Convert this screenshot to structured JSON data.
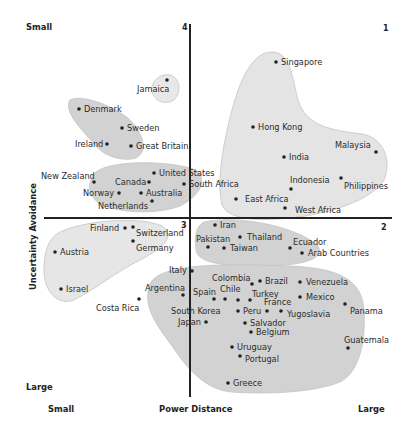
{
  "chart_data": {
    "type": "scatter",
    "title": "",
    "xlabel": "Power Distance",
    "ylabel": "Uncertainty Avoidance",
    "x_axis_ends": {
      "left": "Small",
      "right": "Large"
    },
    "y_axis_ends": {
      "top": "Small",
      "bottom": "Large"
    },
    "quadrant_labels": {
      "q1": "1",
      "q2": "2",
      "q3": "3",
      "q4": "4"
    },
    "grid": false,
    "legend": null,
    "axes_cross": {
      "x_px": 190,
      "y_px": 218
    },
    "clusters": [
      {
        "name": "jamaica",
        "members": [
          "Jamaica"
        ]
      },
      {
        "name": "nordic-uk",
        "members": [
          "Denmark",
          "Sweden",
          "Ireland",
          "Great Britain"
        ]
      },
      {
        "name": "anglo",
        "members": [
          "New Zealand",
          "Canada",
          "Norway",
          "Australia",
          "Netherlands",
          "United States",
          "South Africa"
        ]
      },
      {
        "name": "asia-africa-high-pd",
        "members": [
          "Singapore",
          "Hong Kong",
          "India",
          "Malaysia",
          "Indonesia",
          "Philippines",
          "East Africa",
          "West Africa"
        ]
      },
      {
        "name": "germanic",
        "members": [
          "Finland",
          "Switzerland",
          "Germany",
          "Austria",
          "Israel"
        ]
      },
      {
        "name": "middle-east-asia",
        "members": [
          "Iran",
          "Pakistan",
          "Thailand",
          "Taiwan",
          "Ecuador",
          "Arab Countries"
        ]
      },
      {
        "name": "latin-med",
        "members": [
          "Italy",
          "Argentina",
          "Costa Rica",
          "Colombia",
          "Brazil",
          "Spain",
          "Chile",
          "Turkey",
          "South Korea",
          "France",
          "Peru",
          "Japan",
          "Salvador",
          "Belgium",
          "Venezuela",
          "Mexico",
          "Yugoslavia",
          "Panama",
          "Guatemala",
          "Uruguay",
          "Portugal",
          "Greece"
        ]
      }
    ],
    "points": [
      {
        "label": "Jamaica",
        "x": 167,
        "y": 80
      },
      {
        "label": "Denmark",
        "x": 79,
        "y": 109
      },
      {
        "label": "Sweden",
        "x": 122,
        "y": 128
      },
      {
        "label": "Ireland",
        "x": 107,
        "y": 144
      },
      {
        "label": "Great Britain",
        "x": 131,
        "y": 146
      },
      {
        "label": "New Zealand",
        "x": 94,
        "y": 182
      },
      {
        "label": "Canada",
        "x": 149,
        "y": 182
      },
      {
        "label": "Norway",
        "x": 119,
        "y": 193
      },
      {
        "label": "Australia",
        "x": 141,
        "y": 193
      },
      {
        "label": "Netherlands",
        "x": 152,
        "y": 201
      },
      {
        "label": "United States",
        "x": 154,
        "y": 173
      },
      {
        "label": "South Africa",
        "x": 184,
        "y": 184
      },
      {
        "label": "Singapore",
        "x": 276,
        "y": 62
      },
      {
        "label": "Hong Kong",
        "x": 253,
        "y": 127
      },
      {
        "label": "India",
        "x": 284,
        "y": 157
      },
      {
        "label": "Malaysia",
        "x": 376,
        "y": 152
      },
      {
        "label": "Indonesia",
        "x": 291,
        "y": 189
      },
      {
        "label": "Philippines",
        "x": 341,
        "y": 178
      },
      {
        "label": "East Africa",
        "x": 236,
        "y": 199
      },
      {
        "label": "West Africa",
        "x": 285,
        "y": 208
      },
      {
        "label": "Iran",
        "x": 215,
        "y": 225
      },
      {
        "label": "Pakistan",
        "x": 208,
        "y": 247
      },
      {
        "label": "Thailand",
        "x": 240,
        "y": 237
      },
      {
        "label": "Taiwan",
        "x": 224,
        "y": 248
      },
      {
        "label": "Ecuador",
        "x": 290,
        "y": 248
      },
      {
        "label": "Arab Countries",
        "x": 302,
        "y": 253
      },
      {
        "label": "Finland",
        "x": 125,
        "y": 228
      },
      {
        "label": "Switzerland",
        "x": 133,
        "y": 227
      },
      {
        "label": "Germany",
        "x": 133,
        "y": 241
      },
      {
        "label": "Austria",
        "x": 55,
        "y": 252
      },
      {
        "label": "Israel",
        "x": 61,
        "y": 289
      },
      {
        "label": "Italy",
        "x": 192,
        "y": 271
      },
      {
        "label": "Argentina",
        "x": 183,
        "y": 295
      },
      {
        "label": "Costa Rica",
        "x": 139,
        "y": 299
      },
      {
        "label": "Colombia",
        "x": 252,
        "y": 284
      },
      {
        "label": "Brazil",
        "x": 260,
        "y": 281
      },
      {
        "label": "Spain",
        "x": 214,
        "y": 299
      },
      {
        "label": "Chile",
        "x": 225,
        "y": 299
      },
      {
        "label": "Turkey",
        "x": 250,
        "y": 300
      },
      {
        "label": "South Korea",
        "x": 238,
        "y": 300
      },
      {
        "label": "France",
        "x": 267,
        "y": 311
      },
      {
        "label": "Peru",
        "x": 238,
        "y": 311
      },
      {
        "label": "Japan",
        "x": 206,
        "y": 322
      },
      {
        "label": "Salvador",
        "x": 245,
        "y": 323
      },
      {
        "label": "Belgium",
        "x": 251,
        "y": 332
      },
      {
        "label": "Venezuela",
        "x": 300,
        "y": 282
      },
      {
        "label": "Mexico",
        "x": 300,
        "y": 297
      },
      {
        "label": "Yugoslavia",
        "x": 281,
        "y": 311
      },
      {
        "label": "Panama",
        "x": 345,
        "y": 304
      },
      {
        "label": "Guatemala",
        "x": 348,
        "y": 348
      },
      {
        "label": "Uruguay",
        "x": 232,
        "y": 347
      },
      {
        "label": "Portugal",
        "x": 240,
        "y": 356
      },
      {
        "label": "Greece",
        "x": 228,
        "y": 383
      }
    ]
  },
  "axes": {
    "x_title": "Power Distance",
    "x_small": "Small",
    "x_large": "Large",
    "y_title": "Uncertainty Avoidance",
    "y_small": "Small",
    "y_large": "Large"
  },
  "quadrants": {
    "q1": "1",
    "q2": "2",
    "q3": "3",
    "q4": "4"
  },
  "colors": {
    "blob_fill": "#d5d5d5",
    "blob_light": "#e6e6e6",
    "axis": "#222222",
    "text": "#2b2b2b"
  },
  "labels": [
    {
      "text": "Jamaica",
      "x": 137,
      "y": 92
    },
    {
      "text": "Denmark",
      "x": 84,
      "y": 112
    },
    {
      "text": "Sweden",
      "x": 127,
      "y": 131
    },
    {
      "text": "Ireland",
      "x": 75,
      "y": 147
    },
    {
      "text": "Great Britain",
      "x": 136,
      "y": 149
    },
    {
      "text": "New Zealand",
      "x": 41,
      "y": 179
    },
    {
      "text": "Canada",
      "x": 115,
      "y": 185
    },
    {
      "text": "Norway",
      "x": 83,
      "y": 196
    },
    {
      "text": "Australia",
      "x": 146,
      "y": 196
    },
    {
      "text": "Netherlands",
      "x": 98,
      "y": 209
    },
    {
      "text": "United States",
      "x": 159,
      "y": 176
    },
    {
      "text": "South Africa",
      "x": 189,
      "y": 187
    },
    {
      "text": "Singapore",
      "x": 281,
      "y": 65
    },
    {
      "text": "Hong Kong",
      "x": 258,
      "y": 130
    },
    {
      "text": "India",
      "x": 289,
      "y": 160
    },
    {
      "text": "Malaysia",
      "x": 335,
      "y": 148
    },
    {
      "text": "Indonesia",
      "x": 290,
      "y": 183
    },
    {
      "text": "Philippines",
      "x": 344,
      "y": 189
    },
    {
      "text": "East Africa",
      "x": 245,
      "y": 202
    },
    {
      "text": "West Africa",
      "x": 295,
      "y": 213
    },
    {
      "text": "Iran",
      "x": 220,
      "y": 228
    },
    {
      "text": "Pakistan",
      "x": 196,
      "y": 242
    },
    {
      "text": "Thailand",
      "x": 247,
      "y": 240
    },
    {
      "text": "Taiwan",
      "x": 230,
      "y": 251
    },
    {
      "text": "Ecuador",
      "x": 293,
      "y": 245
    },
    {
      "text": "Arab Countries",
      "x": 308,
      "y": 256
    },
    {
      "text": "Finland",
      "x": 90,
      "y": 231
    },
    {
      "text": "Switzerland",
      "x": 136,
      "y": 236
    },
    {
      "text": "Germany",
      "x": 136,
      "y": 251
    },
    {
      "text": "Austria",
      "x": 60,
      "y": 255
    },
    {
      "text": "Israel",
      "x": 66,
      "y": 292
    },
    {
      "text": "Italy",
      "x": 169,
      "y": 273
    },
    {
      "text": "Argentina",
      "x": 145,
      "y": 291
    },
    {
      "text": "Costa Rica",
      "x": 96,
      "y": 311
    },
    {
      "text": "Colombia",
      "x": 212,
      "y": 281
    },
    {
      "text": "Brazil",
      "x": 265,
      "y": 284
    },
    {
      "text": "Spain",
      "x": 193,
      "y": 295
    },
    {
      "text": "Chile",
      "x": 220,
      "y": 292
    },
    {
      "text": "Turkey",
      "x": 252,
      "y": 297
    },
    {
      "text": "South Korea",
      "x": 171,
      "y": 314
    },
    {
      "text": "France",
      "x": 264,
      "y": 305
    },
    {
      "text": "Peru",
      "x": 243,
      "y": 314
    },
    {
      "text": "Japan",
      "x": 178,
      "y": 325
    },
    {
      "text": "Salvador",
      "x": 250,
      "y": 326
    },
    {
      "text": "Belgium",
      "x": 256,
      "y": 335
    },
    {
      "text": "Venezuela",
      "x": 306,
      "y": 285
    },
    {
      "text": "Mexico",
      "x": 306,
      "y": 300
    },
    {
      "text": "Yugoslavia",
      "x": 287,
      "y": 317
    },
    {
      "text": "Panama",
      "x": 350,
      "y": 314
    },
    {
      "text": "Guatemala",
      "x": 344,
      "y": 343
    },
    {
      "text": "Uruguay",
      "x": 237,
      "y": 350
    },
    {
      "text": "Portugal",
      "x": 245,
      "y": 362
    },
    {
      "text": "Greece",
      "x": 233,
      "y": 386
    }
  ]
}
